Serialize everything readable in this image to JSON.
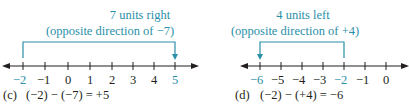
{
  "colors": {
    "accent": "#2a8fa8",
    "ink": "#231f20"
  },
  "panels": [
    {
      "id": "c",
      "label": "(c)",
      "equation": "(−2) − (−7) = +5",
      "annotation_line1": "7 units right",
      "annotation_line2": "(opposite direction of −7)",
      "ticks": [
        "−2",
        "−1",
        "0",
        "1",
        "2",
        "3",
        "4",
        "5"
      ],
      "start": "−2",
      "end": "5",
      "direction": "right",
      "units": 7
    },
    {
      "id": "d",
      "label": "(d)",
      "equation": "(−2) − (+4) = −6",
      "annotation_line1": "4 units left",
      "annotation_line2": "(opposite direction of +4)",
      "ticks": [
        "−6",
        "−5",
        "−4",
        "−3",
        "−2",
        "−1",
        "0"
      ],
      "start": "−2",
      "end": "−6",
      "direction": "left",
      "units": 4
    }
  ]
}
